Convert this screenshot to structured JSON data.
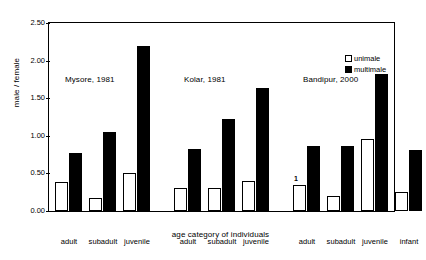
{
  "chart_data": {
    "type": "bar",
    "title": "",
    "xlabel": "age category of individuals",
    "ylabel": "male / female",
    "ylim": [
      0.0,
      2.5
    ],
    "ytick_labels": [
      "0.00",
      "0.50",
      "1.00",
      "1.50",
      "2.00",
      "2.50"
    ],
    "ytick_values": [
      0.0,
      0.5,
      1.0,
      1.5,
      2.0,
      2.5
    ],
    "grid": false,
    "legend_position": "top-right",
    "legend": [
      "unimale",
      "multimale"
    ],
    "series": [
      {
        "name": "unimale",
        "color": "#ffffff"
      },
      {
        "name": "multimale",
        "color": "#000000"
      }
    ],
    "groups": [
      {
        "label": "Mysore, 1981",
        "categories": [
          "adult",
          "subadult",
          "juvenile"
        ],
        "unimale": [
          0.38,
          0.17,
          0.5
        ],
        "multimale": [
          0.77,
          1.05,
          2.19
        ],
        "notes": [
          "",
          "",
          ""
        ]
      },
      {
        "label": "Kolar, 1981",
        "categories": [
          "adult",
          "subadult",
          "juvenile"
        ],
        "unimale": [
          0.31,
          0.3,
          0.4
        ],
        "multimale": [
          0.83,
          1.22,
          1.63
        ],
        "notes": [
          "",
          "",
          ""
        ]
      },
      {
        "label": "Bandipur, 2000",
        "categories": [
          "adult",
          "subadult",
          "juvenile",
          "infant"
        ],
        "unimale": [
          0.35,
          0.2,
          0.96,
          0.25
        ],
        "multimale": [
          0.86,
          0.86,
          1.82,
          0.81
        ],
        "notes": [
          "1",
          "",
          "",
          ""
        ]
      }
    ]
  }
}
